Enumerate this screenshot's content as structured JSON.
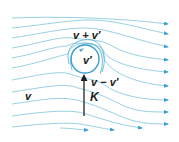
{
  "figure": {
    "labels": {
      "top": "v + v′",
      "center": "v′",
      "bottom_right": "v − v′",
      "force": "K",
      "freestream": "v"
    },
    "colors": {
      "streamline": "#8ccbe0",
      "streamline_dark": "#5fb3d6",
      "cylinder": "#3d9fcf",
      "arrowhead": "#3d9fcf",
      "force_arrow": "#231f20",
      "text": "#231f20"
    },
    "cylinder": {
      "cx": 85,
      "cy": 59,
      "r": 14
    }
  }
}
